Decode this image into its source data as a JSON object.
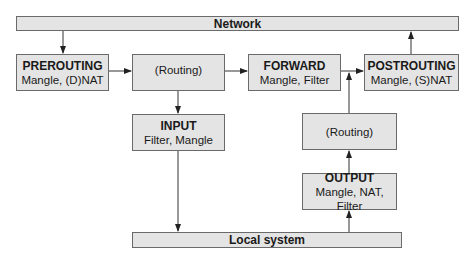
{
  "diagram": {
    "network_bar": {
      "label": "Network"
    },
    "local_bar": {
      "label": "Local system"
    },
    "nodes": {
      "prerouting": {
        "title": "PREROUTING",
        "sub": "Mangle, (D)NAT"
      },
      "routing_top": {
        "title": "",
        "sub": "(Routing)"
      },
      "forward": {
        "title": "FORWARD",
        "sub": "Mangle, Filter"
      },
      "postrouting": {
        "title": "POSTROUTING",
        "sub": "Mangle, (S)NAT"
      },
      "input": {
        "title": "INPUT",
        "sub": "Filter, Mangle"
      },
      "routing_right": {
        "title": "",
        "sub": "(Routing)"
      },
      "output": {
        "title": "OUTPUT",
        "sub": "Mangle, NAT, Filter"
      }
    },
    "edges": [
      [
        "Network",
        "PREROUTING"
      ],
      [
        "PREROUTING",
        "(Routing)"
      ],
      [
        "(Routing)",
        "FORWARD"
      ],
      [
        "(Routing)",
        "INPUT"
      ],
      [
        "FORWARD",
        "POSTROUTING"
      ],
      [
        "INPUT",
        "Local system"
      ],
      [
        "Local system",
        "OUTPUT"
      ],
      [
        "OUTPUT",
        "(Routing)"
      ],
      [
        "(Routing)",
        "POSTROUTING"
      ],
      [
        "POSTROUTING",
        "Network"
      ]
    ],
    "colors": {
      "box_fill": "#e4e4e4",
      "border": "#6a6a6a",
      "line": "#333333"
    }
  }
}
